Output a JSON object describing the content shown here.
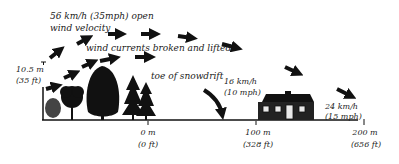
{
  "diagram": {
    "open_wind": {
      "line1": "56 km/h (35mph) open",
      "line2": "wind velocity"
    },
    "broken_label": "wind currents broken and lifted",
    "snowdrift_label": "toe of snowdrift",
    "height_marker": {
      "metric": "10.5 m",
      "imperial": "(35 ft)"
    },
    "speed_near_house": {
      "metric": "16 km/h",
      "imperial": "(10 mph)"
    },
    "speed_after_house": {
      "metric": "24 km/h",
      "imperial": "(15 mph)"
    },
    "axis_ticks": [
      {
        "metric": "0 m",
        "imperial": "(0 ft)"
      },
      {
        "metric": "100 m",
        "imperial": "(328 ft)"
      },
      {
        "metric": "200 m",
        "imperial": "(656 ft)"
      }
    ],
    "icons": [
      "wind-arrow-icon",
      "shrub-icon",
      "deciduous-tree-icon",
      "conifer-tree-icon",
      "house-icon",
      "snowdrift-arrow-icon"
    ],
    "colors": {
      "ink": "#111111",
      "shrub": "#444444",
      "house_window": "#e8e8e8",
      "background": "#ffffff"
    }
  }
}
